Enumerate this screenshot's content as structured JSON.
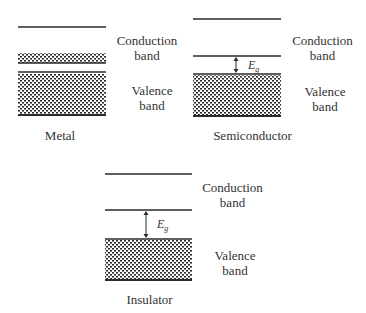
{
  "diagram": {
    "title": "",
    "panels": [
      {
        "name": "Metal",
        "conduction_label_line1": "Conduction",
        "conduction_label_line2": "band",
        "valence_label_line1": "Valence",
        "valence_label_line2": "band",
        "caption": "Metal",
        "gap_label": null,
        "overlap": true
      },
      {
        "name": "Semiconductor",
        "conduction_label_line1": "Conduction",
        "conduction_label_line2": "band",
        "valence_label_line1": "Valence",
        "valence_label_line2": "band",
        "caption": "Semiconductor",
        "gap_label": "E",
        "gap_subscript": "g",
        "gap_size": "small"
      },
      {
        "name": "Insulator",
        "conduction_label_line1": "Conduction",
        "conduction_label_line2": "band",
        "valence_label_line1": "Valence",
        "valence_label_line2": "band",
        "caption": "Insulator",
        "gap_label": "E",
        "gap_subscript": "g",
        "gap_size": "large"
      }
    ],
    "colors": {
      "line": "#2a2a2a",
      "fill_dots": "#2a2a2a",
      "background": "#ffffff"
    }
  }
}
